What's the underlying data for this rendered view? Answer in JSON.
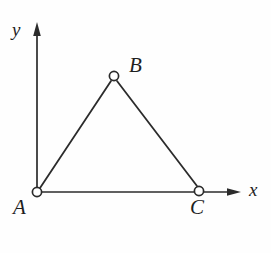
{
  "figure": {
    "caption": "Triangle ABC on coordinate axes",
    "background_color": "#fefefe",
    "ink_color": "#2b2b2b",
    "axes": {
      "x_axis_label": "x",
      "y_axis_label": "y",
      "origin_label": "A",
      "x_axis": {
        "start_x": 37,
        "start_y": 192,
        "end_x": 241,
        "end_y": 192,
        "arrow": true
      },
      "y_axis": {
        "start_x": 37,
        "start_y": 192,
        "end_x": 37,
        "end_y": 24,
        "arrow": true
      }
    },
    "vertices": [
      {
        "label": "A",
        "x": 37,
        "y": 192,
        "radius": 4.6,
        "label_dx": -24,
        "label_dy": 5
      },
      {
        "label": "B",
        "x": 114,
        "y": 76,
        "radius": 4.6,
        "label_dx": 15,
        "label_dy": -21
      },
      {
        "label": "C",
        "x": 199,
        "y": 191,
        "radius": 4.6,
        "label_dx": -9,
        "label_dy": 6
      }
    ],
    "edges": [
      {
        "name": "AB",
        "from": "A",
        "to": "B"
      },
      {
        "name": "BC",
        "from": "B",
        "to": "C"
      },
      {
        "name": "AC",
        "from": "A",
        "to": "C"
      }
    ],
    "notes": {
      "ac_on_x_axis": "Side AC lies along the x-axis",
      "a_at_origin": "Vertex A is located at the origin"
    }
  }
}
